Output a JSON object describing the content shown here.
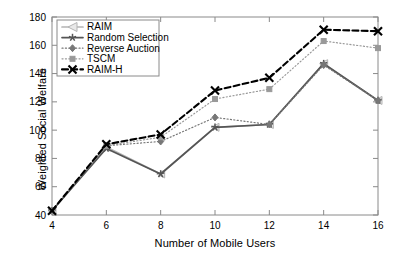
{
  "chart_data": {
    "type": "line",
    "title": "",
    "xlabel": "Number of Mobile Users",
    "ylabel": "Weighted Social Welfare",
    "x": [
      4,
      6,
      8,
      10,
      12,
      14,
      16
    ],
    "xlim": [
      4,
      16
    ],
    "ylim": [
      40,
      180
    ],
    "xticks": [
      "4",
      "6",
      "8",
      "10",
      "12",
      "14",
      "16"
    ],
    "yticks": [
      "40",
      "60",
      "80",
      "100",
      "120",
      "140",
      "160",
      "180"
    ],
    "grid": false,
    "legend_position": "top-left",
    "series": [
      {
        "name": "RAIM",
        "marker": "left-triangle",
        "linestyle": "solid",
        "color": "#b4b4b4",
        "values": [
          43,
          88,
          69,
          102,
          104,
          147,
          121
        ]
      },
      {
        "name": "Random Selection",
        "marker": "star",
        "linestyle": "solid",
        "color": "#555555",
        "values": [
          43,
          87,
          69,
          102,
          104,
          147,
          121
        ]
      },
      {
        "name": "Reverse Auction",
        "marker": "diamond",
        "linestyle": "dotted",
        "color": "#777777",
        "values": [
          43,
          89,
          92,
          109,
          104,
          146,
          121
        ]
      },
      {
        "name": "TSCM",
        "marker": "square",
        "linestyle": "dotted",
        "color": "#999999",
        "values": [
          43,
          89,
          95,
          122,
          129,
          163,
          158
        ]
      },
      {
        "name": "RAIM-H",
        "marker": "x",
        "linestyle": "dashed",
        "color": "#000000",
        "values": [
          43,
          90,
          97,
          128,
          137,
          171,
          170
        ]
      }
    ]
  },
  "axes": {
    "xlabel": "Number of Mobile Users",
    "ylabel": "Weighted Social Welfare"
  },
  "legend": {
    "entries": [
      {
        "label": "RAIM"
      },
      {
        "label": "Random Selection"
      },
      {
        "label": "Reverse Auction"
      },
      {
        "label": "TSCM"
      },
      {
        "label": "RAIM-H"
      }
    ]
  }
}
